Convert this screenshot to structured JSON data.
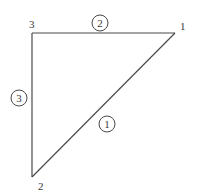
{
  "diagram": {
    "type": "triangle-element",
    "nodes": [
      {
        "id": "1",
        "label": "1",
        "x": 175,
        "y": 33,
        "label_x": 180,
        "label_y": 30
      },
      {
        "id": "2",
        "label": "2",
        "x": 32,
        "y": 177,
        "label_x": 38,
        "label_y": 190
      },
      {
        "id": "3",
        "label": "3",
        "x": 32,
        "y": 33,
        "label_x": 29,
        "label_y": 28
      }
    ],
    "edges": [
      {
        "id": "1",
        "label": "1",
        "from": "1",
        "to": "2",
        "circle_x": 107,
        "circle_y": 124
      },
      {
        "id": "2",
        "label": "2",
        "from": "3",
        "to": "1",
        "circle_x": 100,
        "circle_y": 23
      },
      {
        "id": "3",
        "label": "3",
        "from": "2",
        "to": "3",
        "circle_x": 19,
        "circle_y": 98
      }
    ],
    "colors": {
      "stroke": "#4a4a4a",
      "text": "#3a3a3a",
      "background": "#ffffff"
    }
  }
}
